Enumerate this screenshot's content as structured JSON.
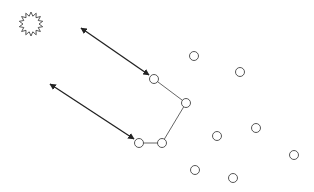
{
  "diagram": {
    "width": 314,
    "height": 192,
    "background": "#ffffff",
    "stroke_color": "#333333",
    "node_radius": 4.5,
    "starburst": {
      "cx": 31,
      "cy": 24,
      "r_outer": 12,
      "r_inner": 8,
      "points": 14
    },
    "nodes": [
      {
        "id": "n1",
        "x": 194,
        "y": 56
      },
      {
        "id": "n2",
        "x": 240,
        "y": 72
      },
      {
        "id": "n3",
        "x": 154,
        "y": 79
      },
      {
        "id": "n4",
        "x": 186,
        "y": 103
      },
      {
        "id": "n5",
        "x": 256,
        "y": 128
      },
      {
        "id": "n6",
        "x": 217,
        "y": 136
      },
      {
        "id": "n7",
        "x": 139,
        "y": 143
      },
      {
        "id": "n8",
        "x": 162,
        "y": 143
      },
      {
        "id": "n9",
        "x": 294,
        "y": 155
      },
      {
        "id": "n10",
        "x": 195,
        "y": 170
      },
      {
        "id": "n11",
        "x": 233,
        "y": 178
      }
    ],
    "path": [
      "n3",
      "n4",
      "n8",
      "n7"
    ],
    "arrows": [
      {
        "x1": 81,
        "y1": 28,
        "x2": 149,
        "y2": 75,
        "heads": "both"
      },
      {
        "x1": 50,
        "y1": 84,
        "x2": 134,
        "y2": 139,
        "heads": "both"
      }
    ]
  }
}
